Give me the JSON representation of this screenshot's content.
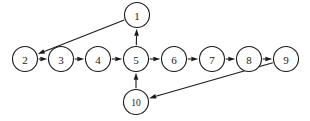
{
  "figure": {
    "title": "",
    "background_color": "#ffffff",
    "stroke_color": "#1a1a1a",
    "width": 310,
    "height": 121
  },
  "chart_data": {
    "type": "diagram",
    "diagram_kind": "directed-graph",
    "title": "",
    "xlabel": "",
    "ylabel": "",
    "grid": false,
    "legend": null,
    "node_radius": 12.5,
    "nodes": [
      {
        "id": "1",
        "label": "1",
        "x": 137,
        "y": 15,
        "r": 12.5
      },
      {
        "id": "2",
        "label": "2",
        "x": 25,
        "y": 59,
        "r": 12.5
      },
      {
        "id": "3",
        "label": "3",
        "x": 61,
        "y": 59,
        "r": 12.5
      },
      {
        "id": "4",
        "label": "4",
        "x": 98,
        "y": 59,
        "r": 12.5
      },
      {
        "id": "5",
        "label": "5",
        "x": 136,
        "y": 59,
        "r": 12.5
      },
      {
        "id": "6",
        "label": "6",
        "x": 174,
        "y": 59,
        "r": 12.5
      },
      {
        "id": "7",
        "label": "7",
        "x": 212,
        "y": 59,
        "r": 12.5
      },
      {
        "id": "8",
        "label": "8",
        "x": 249,
        "y": 59,
        "r": 12.5
      },
      {
        "id": "9",
        "label": "9",
        "x": 286,
        "y": 59,
        "r": 12.5
      },
      {
        "id": "10",
        "label": "10",
        "x": 136,
        "y": 102,
        "r": 12.5
      }
    ],
    "edges": [
      {
        "from": "2",
        "to": "3",
        "directed": true,
        "shape": "straight"
      },
      {
        "from": "3",
        "to": "4",
        "directed": true,
        "shape": "straight"
      },
      {
        "from": "4",
        "to": "5",
        "directed": true,
        "shape": "straight"
      },
      {
        "from": "5",
        "to": "6",
        "directed": true,
        "shape": "straight"
      },
      {
        "from": "6",
        "to": "7",
        "directed": true,
        "shape": "straight"
      },
      {
        "from": "7",
        "to": "8",
        "directed": true,
        "shape": "straight"
      },
      {
        "from": "8",
        "to": "9",
        "directed": true,
        "shape": "straight"
      },
      {
        "from": "5",
        "to": "1",
        "directed": true,
        "shape": "straight"
      },
      {
        "from": "1",
        "to": "2",
        "directed": true,
        "shape": "straight"
      },
      {
        "from": "10",
        "to": "5",
        "directed": true,
        "shape": "straight"
      },
      {
        "from": "9",
        "to": "10",
        "directed": true,
        "shape": "straight"
      }
    ]
  }
}
